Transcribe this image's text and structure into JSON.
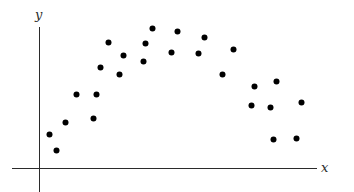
{
  "chart_data": {
    "type": "scatter",
    "title": "",
    "xlabel": "x",
    "ylabel": "y",
    "grid": false,
    "legend": null,
    "ticks": {
      "x": [],
      "y": []
    },
    "note": "Unitless axes with no tick marks; coordinates given in pixel units measured from the axis origin.",
    "xlim": [
      -27,
      278
    ],
    "ylim": [
      -24,
      141
    ],
    "points": [
      {
        "x": 10,
        "y": 34
      },
      {
        "x": 17,
        "y": 18
      },
      {
        "x": 26,
        "y": 46
      },
      {
        "x": 37,
        "y": 74
      },
      {
        "x": 54,
        "y": 50
      },
      {
        "x": 57,
        "y": 74
      },
      {
        "x": 61,
        "y": 101
      },
      {
        "x": 69,
        "y": 126
      },
      {
        "x": 80,
        "y": 94
      },
      {
        "x": 84,
        "y": 113
      },
      {
        "x": 104,
        "y": 107
      },
      {
        "x": 106,
        "y": 125
      },
      {
        "x": 113,
        "y": 140
      },
      {
        "x": 132,
        "y": 116
      },
      {
        "x": 138,
        "y": 137
      },
      {
        "x": 159,
        "y": 115
      },
      {
        "x": 165,
        "y": 131
      },
      {
        "x": 183,
        "y": 94
      },
      {
        "x": 194,
        "y": 119
      },
      {
        "x": 212,
        "y": 63
      },
      {
        "x": 215,
        "y": 82
      },
      {
        "x": 231,
        "y": 61
      },
      {
        "x": 237,
        "y": 87
      },
      {
        "x": 234,
        "y": 29
      },
      {
        "x": 257,
        "y": 30
      },
      {
        "x": 262,
        "y": 66
      }
    ],
    "marker": {
      "shape": "circle",
      "size": 6,
      "color": "#000000"
    },
    "axis_color": "#2b2b2b"
  },
  "labels": {
    "x_axis": "x",
    "y_axis": "y"
  }
}
